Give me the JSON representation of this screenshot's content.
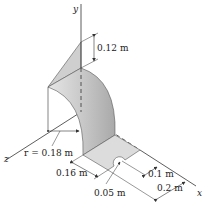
{
  "diagram": {
    "axes": {
      "x": "x",
      "y": "y",
      "z": "z"
    },
    "dimensions": {
      "height_top": "0.12 m",
      "radius": "r = 0.18 m",
      "width_016": "0.16 m",
      "hole_radius": "0.05 m",
      "offset_01": "0.1 m",
      "length_02": "0.2 m"
    },
    "colors": {
      "surface_light": "#d9d9d9",
      "surface_mid": "#bdbdbd",
      "surface_dark": "#a8a8a8",
      "line": "#333333"
    }
  }
}
